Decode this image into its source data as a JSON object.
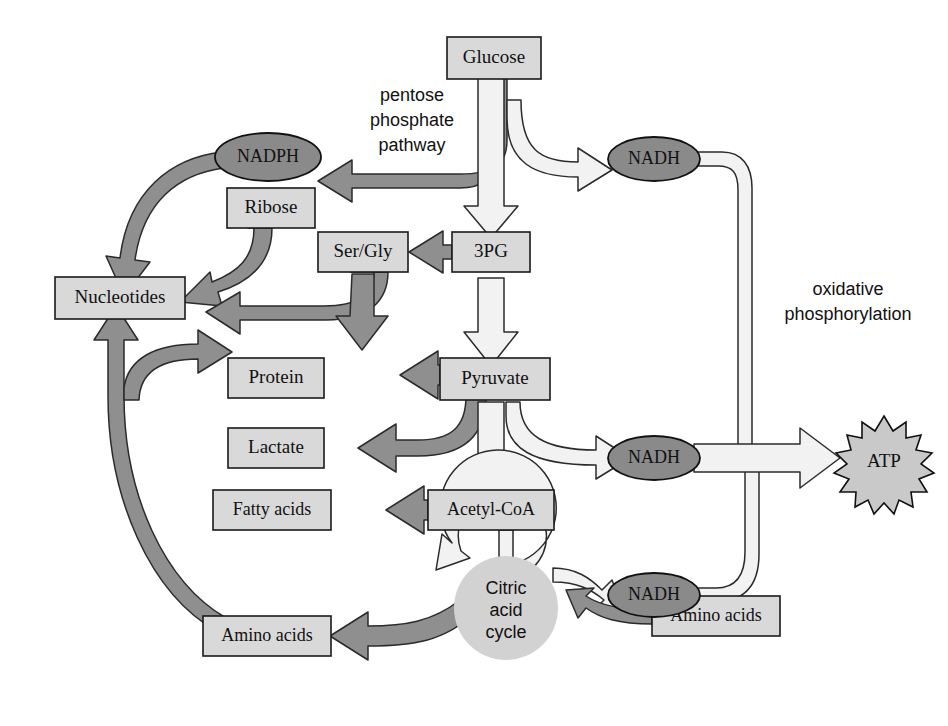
{
  "diagram": {
    "colors": {
      "box_fill": "#d9d9d9",
      "oval_fill": "#8a8a8a",
      "burst_fill": "#c9c9c9",
      "ring_fill": "#d2d2d2",
      "dark_arrow": "#8f8f8f",
      "light_arrow": "#f2f2f2",
      "outline": "#1a1a1a",
      "background": "#ffffff"
    },
    "nodes": {
      "glucose": "Glucose",
      "nadph": "NADPH",
      "ribose": "Ribose",
      "nucleotides": "Nucleotides",
      "ser_gly": "Ser/Gly",
      "three_pg": "3PG",
      "protein": "Protein",
      "pyruvate": "Pyruvate",
      "lactate": "Lactate",
      "fatty_acids": "Fatty acids",
      "acetyl_coa": "Acetyl-CoA",
      "amino_acids_left": "Amino acids",
      "amino_acids_right": "Amino acids",
      "nadh_top": "NADH",
      "nadh_middle": "NADH",
      "nadh_bottom": "NADH",
      "atp": "ATP"
    },
    "cycle": {
      "line1": "Citric",
      "line2": "acid",
      "line3": "cycle"
    },
    "annotations": {
      "pentose_line1": "pentose",
      "pentose_line2": "phosphate",
      "pentose_line3": "pathway",
      "oxphos_line1": "oxidative",
      "oxphos_line2": "phosphorylation"
    }
  }
}
